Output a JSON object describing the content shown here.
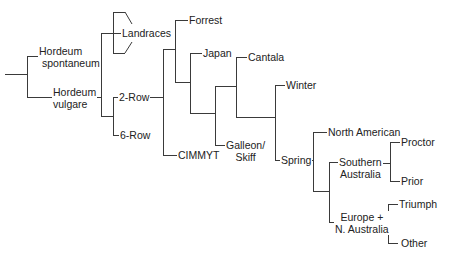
{
  "diagram": {
    "type": "phylogenetic-tree",
    "line_color": "#3a3a3a",
    "text_color": "#222222",
    "background": "#ffffff",
    "nodes": {
      "hordeum_spontaneum": {
        "line1": "Hordeum",
        "line2": "spontaneum"
      },
      "hordeum_vulgare": {
        "line1": "Hordeum",
        "line2": "vulgare"
      },
      "landraces": "Landraces",
      "two_row": "2-Row",
      "six_row": "6-Row",
      "forrest": "Forrest",
      "japan": "Japan",
      "cantala": "Cantala",
      "winter": "Winter",
      "cimmyt": "CIMMYT",
      "galleon_skiff": {
        "line1": "Galleon/",
        "line2": "Skiff"
      },
      "spring": "Spring",
      "north_american": "North American",
      "southern_australia": {
        "line1": "Southern",
        "line2": "Australia"
      },
      "proctor": "Proctor",
      "prior": "Prior",
      "europe_n_australia": {
        "line1": "Europe +",
        "line2": "N. Australia"
      },
      "triumph": "Triumph",
      "other": "Other"
    },
    "edges": [
      [
        "root",
        "hordeum_spontaneum"
      ],
      [
        "root",
        "hordeum_vulgare"
      ],
      [
        "hordeum_vulgare",
        "landraces"
      ],
      [
        "hordeum_vulgare",
        "two_row"
      ],
      [
        "hordeum_vulgare",
        "six_row"
      ],
      [
        "two_row",
        "forrest"
      ],
      [
        "two_row",
        "japan"
      ],
      [
        "two_row",
        "galleon_skiff"
      ],
      [
        "two_row",
        "cantala"
      ],
      [
        "two_row",
        "winter"
      ],
      [
        "two_row",
        "spring"
      ],
      [
        "two_row",
        "cimmyt"
      ],
      [
        "spring",
        "north_american"
      ],
      [
        "spring",
        "southern_australia"
      ],
      [
        "spring",
        "europe_n_australia"
      ],
      [
        "southern_australia",
        "proctor"
      ],
      [
        "southern_australia",
        "prior"
      ],
      [
        "europe_n_australia",
        "triumph"
      ],
      [
        "europe_n_australia",
        "other"
      ]
    ]
  }
}
